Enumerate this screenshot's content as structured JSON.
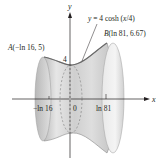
{
  "figure": {
    "type": "surface-of-revolution",
    "curve_label": "y = 4 cosh (x/4)",
    "curve_label_parts": {
      "prefix": "y",
      "eq": " = 4 cosh (",
      "var": "x",
      "suffix": "/4)"
    },
    "point_a": {
      "label": "A(−ln 16, 5)",
      "name": "A",
      "coords": "(−ln 16, 5)"
    },
    "point_b": {
      "label": "B(ln 81, 6.67)",
      "name": "B",
      "coords": "(ln 81, 6.67)"
    },
    "axes": {
      "x_label": "x",
      "y_label": "y",
      "y_tick_label": "4",
      "x_tick_labels": [
        "−ln 16",
        "0",
        "ln 81"
      ]
    },
    "colors": {
      "surface_light": "#f2f2f2",
      "surface_mid": "#d6d6d6",
      "surface_dark": "#a9a9a9",
      "axis": "#231f20"
    }
  }
}
